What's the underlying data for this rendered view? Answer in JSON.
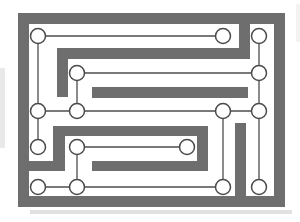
{
  "diagram": {
    "type": "maze-circuit-puzzle",
    "description_of_content": "rectangular thick-walled maze border with inner gray wall bars; sixteen small white circles (nodes) joined by thin straight wires threading between the walls",
    "canvas": {
      "width": 300,
      "height": 222
    },
    "colors": {
      "background": "#ffffff",
      "wall": "#6e6e6e",
      "wire": "#4d4d4d",
      "node_fill": "#ffffff",
      "node_stroke": "#4a4a4a"
    },
    "node_radius": 7.5,
    "wire_width": 1.3,
    "node_stroke_width": 1.5,
    "walls": [
      {
        "name": "outer-border-top",
        "x": 18,
        "y": 13,
        "w": 267,
        "h": 11
      },
      {
        "name": "outer-border-bottom",
        "x": 18,
        "y": 196,
        "w": 267,
        "h": 11
      },
      {
        "name": "outer-border-left",
        "x": 18,
        "y": 13,
        "w": 11,
        "h": 194
      },
      {
        "name": "outer-border-right",
        "x": 274,
        "y": 13,
        "w": 11,
        "h": 194
      },
      {
        "name": "hook-descender-right",
        "x": 239,
        "y": 24,
        "w": 11,
        "h": 35
      },
      {
        "name": "hook-horizontal",
        "x": 57,
        "y": 48,
        "w": 193,
        "h": 11
      },
      {
        "name": "hook-descender-left",
        "x": 57,
        "y": 48,
        "w": 11,
        "h": 49
      },
      {
        "name": "mid-bar",
        "x": 92,
        "y": 87,
        "w": 156,
        "h": 11
      },
      {
        "name": "spiral-bottom-left-stub",
        "x": 22,
        "y": 161,
        "w": 43,
        "h": 10
      },
      {
        "name": "spiral-vertical-left",
        "x": 53,
        "y": 126,
        "w": 12,
        "h": 45
      },
      {
        "name": "spiral-top",
        "x": 53,
        "y": 126,
        "w": 155,
        "h": 10
      },
      {
        "name": "spiral-vertical-right",
        "x": 197,
        "y": 126,
        "w": 11,
        "h": 45
      },
      {
        "name": "spiral-bottom-right",
        "x": 92,
        "y": 161,
        "w": 116,
        "h": 10
      },
      {
        "name": "right-lower-vertical-bar",
        "x": 235,
        "y": 123,
        "w": 11,
        "h": 78
      }
    ],
    "nodes": [
      {
        "id": "a",
        "x": 38,
        "y": 36
      },
      {
        "id": "b",
        "x": 223,
        "y": 36
      },
      {
        "id": "c",
        "x": 259,
        "y": 36
      },
      {
        "id": "d",
        "x": 77,
        "y": 73
      },
      {
        "id": "e",
        "x": 259,
        "y": 73
      },
      {
        "id": "f",
        "x": 38,
        "y": 111
      },
      {
        "id": "g",
        "x": 77,
        "y": 111
      },
      {
        "id": "h",
        "x": 223,
        "y": 111
      },
      {
        "id": "i",
        "x": 259,
        "y": 111
      },
      {
        "id": "j",
        "x": 38,
        "y": 147
      },
      {
        "id": "k",
        "x": 77,
        "y": 147
      },
      {
        "id": "l",
        "x": 187,
        "y": 147
      },
      {
        "id": "m",
        "x": 38,
        "y": 187
      },
      {
        "id": "n",
        "x": 77,
        "y": 187
      },
      {
        "id": "o",
        "x": 223,
        "y": 187
      },
      {
        "id": "p",
        "x": 259,
        "y": 187
      }
    ],
    "edges": [
      {
        "from": "a",
        "to": "b"
      },
      {
        "from": "a",
        "to": "f"
      },
      {
        "from": "c",
        "to": "e"
      },
      {
        "from": "d",
        "to": "e"
      },
      {
        "from": "d",
        "to": "g"
      },
      {
        "from": "e",
        "to": "i"
      },
      {
        "from": "f",
        "to": "g"
      },
      {
        "from": "g",
        "to": "h"
      },
      {
        "from": "h",
        "to": "i"
      },
      {
        "from": "h",
        "to": "o"
      },
      {
        "from": "i",
        "to": "p"
      },
      {
        "from": "f",
        "to": "j"
      },
      {
        "from": "k",
        "to": "l"
      },
      {
        "from": "k",
        "to": "n"
      },
      {
        "from": "m",
        "to": "n"
      },
      {
        "from": "n",
        "to": "o"
      }
    ],
    "scan_artifacts": [
      {
        "name": "left-margin-smudge",
        "x": 0,
        "y": 68,
        "w": 5,
        "h": 80,
        "color": "#9a9a9a",
        "opacity": 0.22
      },
      {
        "name": "bottom-shadow-strip",
        "x": 30,
        "y": 210,
        "w": 262,
        "h": 4,
        "color": "#aaaaaa",
        "opacity": 0.35
      },
      {
        "name": "top-right-edge-smudge",
        "x": 296,
        "y": 4,
        "w": 4,
        "h": 38,
        "color": "#bbbbbb",
        "opacity": 0.18
      }
    ]
  }
}
